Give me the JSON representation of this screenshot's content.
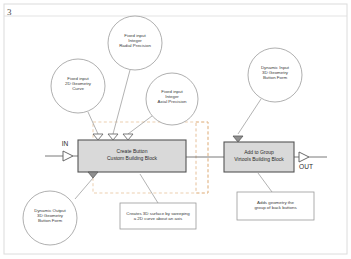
{
  "page": {
    "corner_number": "3",
    "background_color": "#ffffff",
    "sheet_border_color": "#d8d8d8"
  },
  "colors": {
    "block_fill": "#d9d9d9",
    "block_stroke": "#555555",
    "bubble_stroke": "#9a9a9a",
    "note_stroke": "#9a9a9a",
    "note_fill": "#ffffff",
    "wire": "#6b6b6b",
    "leader": "#9a9a9a",
    "selection_dash": "#e8b98a",
    "text": "#3b3b3b"
  },
  "ports": {
    "in_label": "IN",
    "out_label": "OUT"
  },
  "blocks": [
    {
      "id": "create-button",
      "title": "Create Button",
      "subtitle": "Custom Building Block",
      "x": 78,
      "y": 140,
      "w": 108,
      "h": 32
    },
    {
      "id": "add-to-group",
      "title": "Add to Group",
      "subtitle": "Virtools Building Block",
      "x": 224,
      "y": 142,
      "w": 70,
      "h": 30
    }
  ],
  "bubbles": [
    {
      "id": "fixed-input-2d-geometry-curve",
      "lines": "Fixed input\n2D Geometry\nCurve",
      "cx": 78,
      "cy": 86,
      "r": 27
    },
    {
      "id": "fixed-input-integer-radial-precision",
      "lines": "Fixed input\nInteger\nRadial Precision",
      "cx": 135,
      "cy": 43,
      "r": 27
    },
    {
      "id": "fixed-input-integer-axial-precision",
      "lines": "Fixed input\nInteger\nAxial Precision",
      "cx": 172,
      "cy": 99,
      "r": 26
    },
    {
      "id": "dynamic-input-3d-geometry-button-form",
      "lines": "Dynamic Input\n3D Geometry\nButton Form",
      "cx": 275,
      "cy": 75,
      "r": 27
    },
    {
      "id": "dynamic-output-3d-geometry-button-form",
      "lines": "Dynamic Output\n3D Geometry\nButton Form",
      "cx": 50,
      "cy": 218,
      "r": 27
    }
  ],
  "notes": [
    {
      "id": "create-button-note",
      "text": "Creates 3D surface by sweeping\na 2D curve about an axis",
      "x": 120,
      "y": 203,
      "w": 76,
      "h": 26
    },
    {
      "id": "add-to-group-note",
      "text": "Adds geometry the\ngroup of back buttons",
      "x": 237,
      "y": 192,
      "w": 77,
      "h": 28
    }
  ],
  "selection": {
    "id": "selection-marquee",
    "x": 196,
    "y": 122,
    "w": 12,
    "h": 71
  }
}
